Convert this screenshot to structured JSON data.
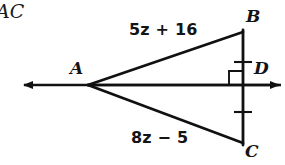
{
  "figure": {
    "kind": "geometry-diagram",
    "corner_text": "AC",
    "stroke_color": "#111111",
    "background_color": "#ffffff",
    "vertices": [
      {
        "name": "point-a",
        "label": "A",
        "x": 88,
        "y": 85
      },
      {
        "name": "point-b",
        "label": "B",
        "x": 243,
        "y": 32
      },
      {
        "name": "point-c",
        "label": "C",
        "x": 243,
        "y": 143
      },
      {
        "name": "point-d",
        "label": "D",
        "x": 243,
        "y": 85
      }
    ],
    "side_labels": {
      "upper": {
        "text": "5z + 16",
        "coefficient": 5,
        "variable": "z",
        "operator": "+",
        "constant": 16,
        "segment": "AB"
      },
      "lower": {
        "text": "8z − 5",
        "coefficient": 8,
        "variable": "z",
        "operator": "−",
        "constant": 5,
        "segment": "AC"
      }
    },
    "markers": {
      "right_angle": {
        "name": "right-angle-marker",
        "at": "D",
        "size": 14
      },
      "congruence_ticks": [
        {
          "name": "tick-mark-bd",
          "segment": "BD",
          "x": 243,
          "y": 62,
          "count": 1
        },
        {
          "name": "tick-mark-dc",
          "segment": "DC",
          "x": 243,
          "y": 112,
          "count": 1
        }
      ]
    },
    "ray": {
      "name": "horizontal-ray",
      "y": 85,
      "x_start": 22,
      "x_end": 281,
      "arrow_left": true,
      "arrow_right": true
    }
  }
}
